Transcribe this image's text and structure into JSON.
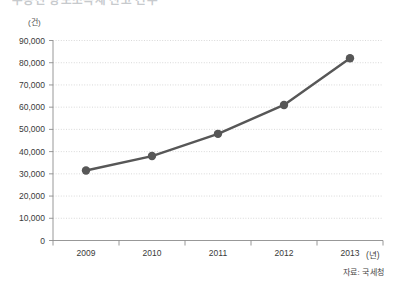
{
  "title": "부동산 양도소득세 신고 건수",
  "source_note": "자료: 국세청",
  "axes": {
    "y_unit": "(건)",
    "x_unit": "(년)"
  },
  "chart_data": {
    "type": "line",
    "title": "부동산 양도소득세 신고 건수",
    "xlabel": "(년)",
    "ylabel": "(건)",
    "categories": [
      "2009",
      "2010",
      "2011",
      "2012",
      "2013"
    ],
    "values": [
      31500,
      38000,
      48000,
      61000,
      82000
    ],
    "ylim": [
      0,
      90000
    ],
    "ytick_step": 10000,
    "ytick_labels": [
      "0",
      "10,000",
      "20,000",
      "30,000",
      "40,000",
      "50,000",
      "60,000",
      "70,000",
      "80,000",
      "90,000"
    ],
    "ytick_values": [
      0,
      10000,
      20000,
      30000,
      40000,
      50000,
      60000,
      70000,
      80000,
      90000
    ],
    "grid": true,
    "grid_style": "dotted-horizontal",
    "legend": false,
    "marker": "circle",
    "series_color": "#575757",
    "grid_color": "#c9c9c9",
    "axis_color": "#8c8c8c",
    "background": "#ffffff",
    "annotations": [
      "자료: 국세청"
    ]
  }
}
